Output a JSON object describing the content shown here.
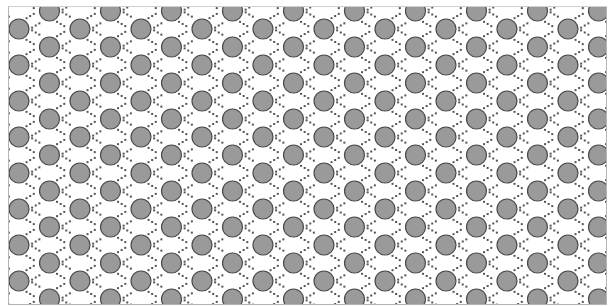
{
  "pattern": {
    "name": "perforated-circle-diamond-pattern",
    "background_color": "#ffffff",
    "circle_fill": "#9a9a9a",
    "circle_stroke": "#4a4a4a",
    "dot_color": "#555555",
    "frame_color": "#b5b5b5",
    "circle_radius": 10,
    "column_spacing": 30.5,
    "row_spacing": 36,
    "columns": 20,
    "rows": 9
  }
}
